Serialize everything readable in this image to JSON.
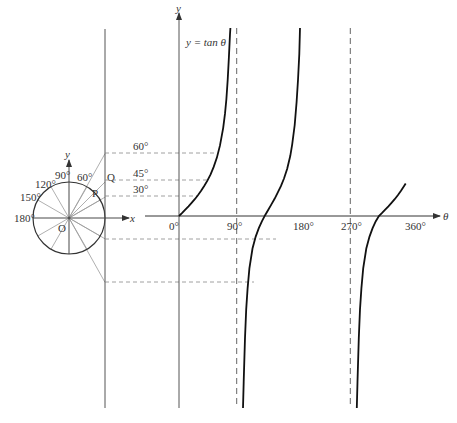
{
  "title": "y = tan θ",
  "unit_circle": {
    "center_label": "O",
    "x_label": "x",
    "y_label": "y",
    "point_P": "P",
    "point_Q": "Q",
    "angle_labels": [
      "30°",
      "60°",
      "90°",
      "120°",
      "150°",
      "180°"
    ]
  },
  "projections": {
    "labels": [
      "60°",
      "45°",
      "30°"
    ]
  },
  "graph": {
    "curve_label": "y = tan θ",
    "y_axis_label": "y",
    "x_axis_label": "θ",
    "x_ticks": [
      "0°",
      "90°",
      "180°",
      "270°",
      "360°"
    ],
    "asymptotes": [
      "90°",
      "270°"
    ]
  },
  "colors": {
    "curve": "#111111",
    "axis": "#555555",
    "dashed": "#888888",
    "rays": "#999999"
  }
}
